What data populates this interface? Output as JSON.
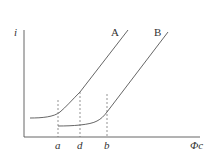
{
  "diagram": {
    "y_axis_label": "i",
    "x_axis_label": "Φc",
    "curves": [
      {
        "name": "A",
        "label": "A"
      },
      {
        "name": "B",
        "label": "B"
      }
    ],
    "x_markers": [
      {
        "label": "a"
      },
      {
        "label": "d"
      },
      {
        "label": "b"
      }
    ],
    "colors": {
      "line": "#555555",
      "text": "#333333"
    }
  }
}
